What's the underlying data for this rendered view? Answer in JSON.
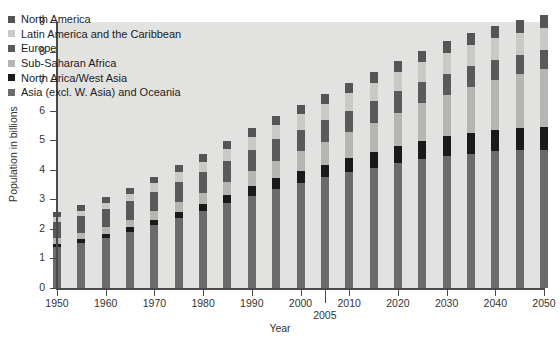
{
  "chart_data": {
    "type": "bar",
    "stacked": true,
    "title": "",
    "xlabel": "Year",
    "ylabel": "Population in billions",
    "ylim": [
      0,
      9
    ],
    "y_ticks": [
      0,
      1,
      2,
      3,
      4,
      5,
      6,
      7,
      8,
      9
    ],
    "y_tick_labels": [
      "0",
      "1",
      "2",
      "3",
      "4",
      "5",
      "6",
      "7",
      "8",
      "9"
    ],
    "xlim": [
      1950,
      2050
    ],
    "x_tick_labels": [
      "1950",
      "1960",
      "1970",
      "1980",
      "1990",
      "2000",
      "2010",
      "2020",
      "2030",
      "2040",
      "2050"
    ],
    "x_ticks": [
      1950,
      1960,
      1970,
      1980,
      1990,
      2000,
      2010,
      2020,
      2030,
      2040,
      2050
    ],
    "special_tick": {
      "value": 2005,
      "label": "2005"
    },
    "grid": false,
    "legend_position": "upper-left",
    "plot_background": "#e2e2e0",
    "categories": [
      "1950",
      "1955",
      "1960",
      "1965",
      "1970",
      "1975",
      "1980",
      "1985",
      "1990",
      "1995",
      "2000",
      "2005",
      "2010",
      "2015",
      "2020",
      "2025",
      "2030",
      "2035",
      "2040",
      "2045",
      "2050"
    ],
    "series": [
      {
        "name": "Asia (excl. W. Asia) and Oceania",
        "color": "#6b6b6b",
        "values": [
          1.4,
          1.54,
          1.7,
          1.9,
          2.12,
          2.37,
          2.6,
          2.87,
          3.13,
          3.36,
          3.56,
          3.74,
          3.91,
          4.07,
          4.22,
          4.35,
          4.46,
          4.55,
          4.62,
          4.66,
          4.68
        ]
      },
      {
        "name": "North Arica/West Asia",
        "color": "#1a1a1a",
        "values": [
          0.1,
          0.11,
          0.13,
          0.15,
          0.17,
          0.2,
          0.23,
          0.27,
          0.31,
          0.35,
          0.39,
          0.43,
          0.48,
          0.53,
          0.58,
          0.63,
          0.67,
          0.71,
          0.74,
          0.76,
          0.78
        ]
      },
      {
        "name": "Sub-Saharan Africa",
        "color": "#b5b5b1",
        "values": [
          0.18,
          0.2,
          0.23,
          0.26,
          0.3,
          0.34,
          0.39,
          0.46,
          0.52,
          0.6,
          0.68,
          0.77,
          0.88,
          1.0,
          1.13,
          1.27,
          1.41,
          1.55,
          1.69,
          1.82,
          1.94
        ]
      },
      {
        "name": "Europe",
        "color": "#5a5a5a",
        "values": [
          0.55,
          0.57,
          0.6,
          0.63,
          0.66,
          0.68,
          0.69,
          0.71,
          0.72,
          0.73,
          0.73,
          0.73,
          0.73,
          0.73,
          0.72,
          0.71,
          0.7,
          0.69,
          0.67,
          0.66,
          0.65
        ]
      },
      {
        "name": "Latin America and the Caribbean",
        "color": "#c9c9c5",
        "values": [
          0.17,
          0.19,
          0.22,
          0.25,
          0.29,
          0.32,
          0.36,
          0.4,
          0.44,
          0.48,
          0.52,
          0.56,
          0.59,
          0.62,
          0.65,
          0.68,
          0.7,
          0.72,
          0.73,
          0.74,
          0.75
        ]
      },
      {
        "name": "North America",
        "color": "#555555",
        "values": [
          0.17,
          0.19,
          0.2,
          0.21,
          0.23,
          0.24,
          0.25,
          0.27,
          0.28,
          0.3,
          0.31,
          0.33,
          0.34,
          0.36,
          0.38,
          0.39,
          0.41,
          0.42,
          0.43,
          0.44,
          0.45
        ]
      }
    ],
    "legend": [
      {
        "label": "North America",
        "color": "#555555"
      },
      {
        "label": "Latin America and the Caribbean",
        "color": "#c9c9c5"
      },
      {
        "label": "Europe",
        "color": "#5a5a5a"
      },
      {
        "label": "Sub-Saharan Africa",
        "color": "#b5b5b1"
      },
      {
        "label": "North Arica/West Asia",
        "color": "#1a1a1a"
      },
      {
        "label": "Asia (excl. W. Asia) and Oceania",
        "color": "#6b6b6b"
      }
    ]
  }
}
